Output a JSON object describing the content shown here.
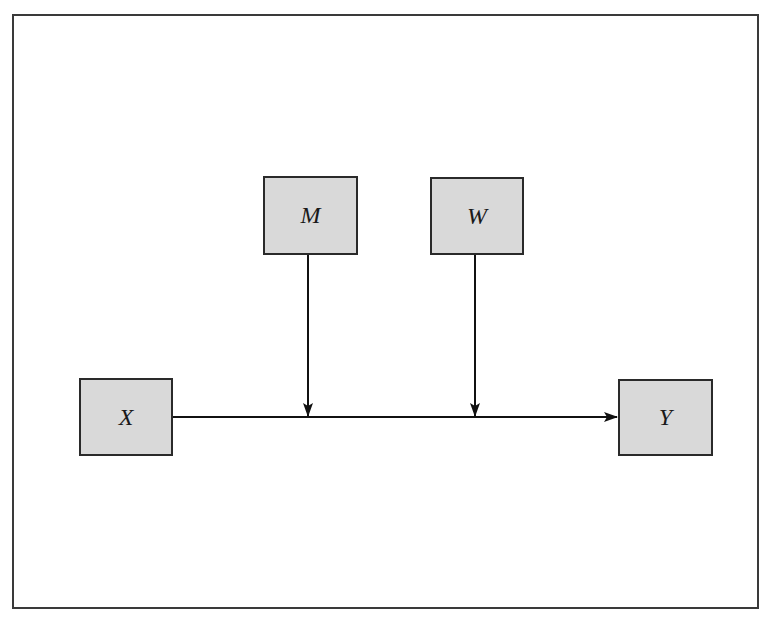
{
  "colors": {
    "box_fill": "#d9d9d9",
    "stroke": "#1a1a1a",
    "frame": "#3a3a3a",
    "background": "#ffffff"
  },
  "nodes": [
    {
      "id": "M",
      "label": "M",
      "x": 263,
      "y": 176,
      "w": 95,
      "h": 79
    },
    {
      "id": "W",
      "label": "W",
      "x": 430,
      "y": 177,
      "w": 94,
      "h": 78
    },
    {
      "id": "X",
      "label": "X",
      "x": 79,
      "y": 378,
      "w": 94,
      "h": 78
    },
    {
      "id": "Y",
      "label": "Y",
      "x": 618,
      "y": 379,
      "w": 95,
      "h": 77
    }
  ],
  "edges": [
    {
      "from": "X",
      "to": "Y",
      "type": "direct-path"
    },
    {
      "from": "M",
      "to": "X->Y path",
      "type": "moderation"
    },
    {
      "from": "W",
      "to": "X->Y path",
      "type": "moderation"
    }
  ]
}
